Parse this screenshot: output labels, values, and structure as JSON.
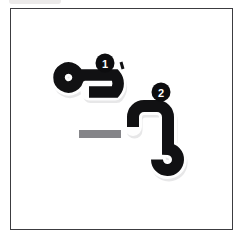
{
  "card": {
    "name": "thai-character-stroke-order-card",
    "background_color": "#ffffff",
    "border_color": "#3c3c40",
    "frame_label": ""
  },
  "top_sliver": {
    "label": "",
    "color": "#eceaea"
  },
  "character": {
    "script": "Thai",
    "glyph": "อ",
    "stroke_count": 2,
    "ink_color": "#111113"
  },
  "strokes": [
    {
      "order": 1,
      "badge_label": "1",
      "name": "loop-and-right-hook",
      "description": "small counter-clockwise loop at left joined to a curve sweeping right and hooking up",
      "badge_color": "#0d0d0f",
      "badge_text_color": "#ffffff"
    },
    {
      "order": 2,
      "badge_label": "2",
      "name": "top-hook-descender-loop",
      "description": "short horizontal head turning right, descending stem, ending in a small loop",
      "badge_color": "#0d0d0f",
      "badge_text_color": "#ffffff"
    }
  ],
  "guide_bar": {
    "name": "baseline-guide-bar",
    "label": "",
    "color": "#858589"
  }
}
